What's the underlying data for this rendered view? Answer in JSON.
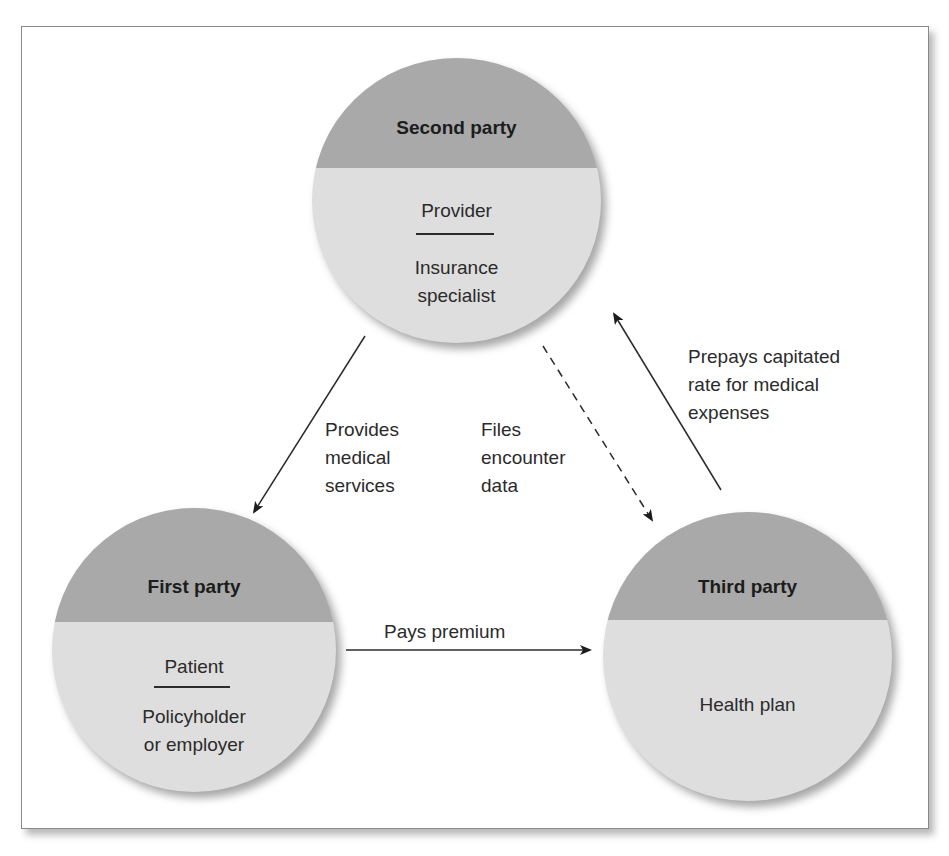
{
  "diagram": {
    "nodes": {
      "second": {
        "title": "Second party",
        "role": "Provider",
        "description": "Insurance\nspecialist"
      },
      "first": {
        "title": "First party",
        "role": "Patient",
        "description": "Policyholder\nor employer"
      },
      "third": {
        "title": "Third party",
        "role": "",
        "description": "Health plan"
      }
    },
    "edges": [
      {
        "from": "second",
        "to": "first",
        "label": "Provides\nmedical\nservices",
        "style": "solid"
      },
      {
        "from": "second",
        "to": "third",
        "label": "Files\nencounter\ndata",
        "style": "dashed"
      },
      {
        "from": "third",
        "to": "second",
        "label": "Prepays capitated\nrate for medical\nexpenses",
        "style": "solid"
      },
      {
        "from": "first",
        "to": "third",
        "label": "Pays premium",
        "style": "solid"
      }
    ],
    "colors": {
      "header_fill": "#a9a9a9",
      "body_fill": "#dedede",
      "border": "#8a8a8a",
      "text": "#2b2b2b"
    }
  }
}
